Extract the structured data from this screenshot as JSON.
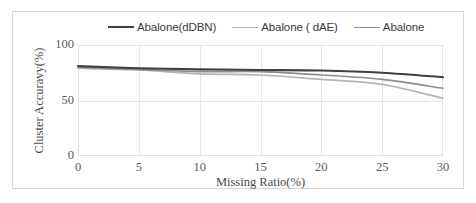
{
  "chart_data": {
    "type": "line",
    "title": "",
    "xlabel": "Missing Ratio(%)",
    "ylabel": "Cluster Accuravy(%)",
    "xlim": [
      0,
      30
    ],
    "ylim": [
      0,
      100
    ],
    "xticks": [
      "0",
      "5",
      "10",
      "15",
      "20",
      "25",
      "30"
    ],
    "yticks": [
      "0",
      "50",
      "100"
    ],
    "grid": true,
    "legend_position": "top",
    "x": [
      0,
      5,
      10,
      15,
      20,
      25,
      30
    ],
    "series": [
      {
        "name": "Abalone(dDBN)",
        "color": "#404040",
        "width": 2.1,
        "values": [
          81,
          79,
          78,
          77.5,
          77,
          75,
          71
        ]
      },
      {
        "name": "Abalone ( dAE)",
        "color": "#b4b4b4",
        "width": 1.6,
        "values": [
          79,
          77.5,
          74,
          73,
          69,
          64.5,
          52
        ]
      },
      {
        "name": "Abalone",
        "color": "#8e8e8e",
        "width": 1.6,
        "values": [
          80,
          78,
          76,
          76,
          73,
          69,
          61
        ]
      }
    ]
  },
  "legend": {
    "entries": [
      {
        "label": "Abalone(dDBN)",
        "color": "#404040",
        "width": 2.4
      },
      {
        "label": "Abalone ( dAE)",
        "color": "#b4b4b4",
        "width": 1.8
      },
      {
        "label": "Abalone",
        "color": "#8e8e8e",
        "width": 1.8
      }
    ]
  },
  "axes": {
    "y_title": "Cluster Accuravy(%)",
    "x_title": "Missing Ratio(%)",
    "y_tick_labels": [
      "100",
      "50",
      "0"
    ],
    "x_tick_labels": [
      "0",
      "5",
      "10",
      "15",
      "20",
      "25",
      "30"
    ]
  }
}
